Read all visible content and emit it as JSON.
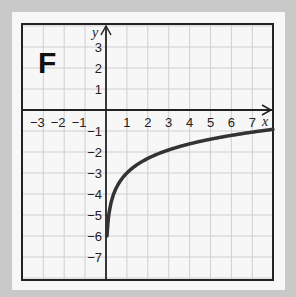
{
  "panel_label": "F",
  "axes": {
    "x_label": "x",
    "y_label": "y",
    "x_ticks": [
      "-3",
      "-2",
      "-1",
      "1",
      "2",
      "3",
      "4",
      "5",
      "6",
      "7"
    ],
    "y_ticks": [
      "3",
      "2",
      "1",
      "-1",
      "-2",
      "-3",
      "-4",
      "-5",
      "-6",
      "-7"
    ]
  },
  "colors": {
    "background": "#c9c9c9",
    "paper": "#f7f7f7",
    "grid": "#cfcfcf",
    "axis": "#222222",
    "curve": "#333333"
  },
  "chart_data": {
    "type": "line",
    "title": "F",
    "xlabel": "x",
    "ylabel": "y",
    "xlim": [
      -4,
      8
    ],
    "ylim": [
      -8,
      4
    ],
    "grid": true,
    "x_ticks": [
      -3,
      -2,
      -1,
      1,
      2,
      3,
      4,
      5,
      6,
      7
    ],
    "y_ticks": [
      3,
      2,
      1,
      -1,
      -2,
      -3,
      -4,
      -5,
      -6,
      -7
    ],
    "series": [
      {
        "name": "curve",
        "description": "logarithmic curve approximately y = ln(x) - 3, starting near (0, -6)",
        "x": [
          0.05,
          0.1,
          0.25,
          0.5,
          1,
          2,
          3,
          4,
          5,
          6,
          7,
          8
        ],
        "values": [
          -6.0,
          -5.3,
          -4.39,
          -3.69,
          -3.0,
          -2.31,
          -1.9,
          -1.61,
          -1.39,
          -1.21,
          -1.05,
          -0.92
        ]
      }
    ]
  }
}
